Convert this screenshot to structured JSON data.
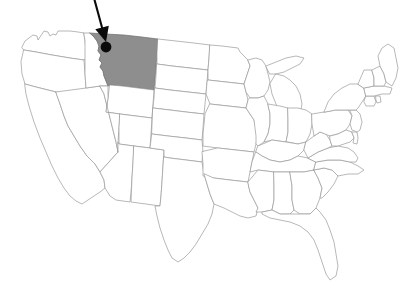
{
  "map": {
    "title": "Map of the United States",
    "type": "choropleth-locator",
    "region": "United States (contiguous 48 states)",
    "background_color": "#ffffff",
    "border_color": "#9a9a9a",
    "default_fill": "#ffffff",
    "highlight_fill": "#8e8e8e",
    "highlight_border_color": "#6f6f6f",
    "marker_color": "#0a0a0a",
    "annotation_color": "#0a0a0a",
    "highlighted_state": "Montana",
    "highlighted_state_abbr": "MT"
  },
  "marker": {
    "name": "location-dot",
    "label": "Marked location in northwestern Montana",
    "color": "#0a0a0a",
    "x": 106,
    "y": 47,
    "radius": 5.4
  },
  "annotation": {
    "name": "pointer-arrow",
    "label": "Arrow pointing to marked location",
    "color": "#0a0a0a",
    "from_x": 94,
    "from_y": -2,
    "to_x": 106,
    "to_y": 42
  },
  "legend": {
    "highlighted_label": "Montana",
    "marker_label": "Marked location"
  },
  "states": [
    {
      "abbr": "WA",
      "name": "Washington",
      "highlighted": false,
      "d": "M22,47 L25,41 L33,35 L37,36 L38,40 L42,34 L44,31 L48,32 L50,36 L53,34 L56,35 L58,31 L63,31 L70,31 L78,32 L84,33 L85,41 L86,50 L86,58 L84,60 L70,58 L52,55 L36,52 L24,50 Z"
    },
    {
      "abbr": "OR",
      "name": "Oregon",
      "highlighted": false,
      "d": "M24,50 L36,52 L52,55 L70,58 L84,60 L85,74 L86,88 L87,98 L70,95 L52,91 L36,87 L25,84 L22,74 L21,62 Z"
    },
    {
      "abbr": "CA",
      "name": "California",
      "highlighted": false,
      "d": "M25,84 L36,87 L52,91 L56,92 L60,104 L64,116 L68,126 L74,136 L80,146 L87,156 L95,164 L100,172 L104,180 L105,188 L100,192 L94,196 L88,200 L82,204 L76,201 L70,196 L64,188 L58,178 L52,166 L46,152 L40,138 L34,122 L29,106 L26,94 Z"
    },
    {
      "abbr": "NV",
      "name": "Nevada",
      "highlighted": false,
      "d": "M56,92 L86,88 L100,86 L104,94 L108,110 L112,126 L116,142 L118,152 L100,172 L95,164 L87,156 L80,146 L74,136 L68,126 L64,116 L60,104 Z"
    },
    {
      "abbr": "ID",
      "name": "Idaho",
      "highlighted": false,
      "d": "M84,33 L90,33 L94,37 L97,41 L99,46 L98,51 L101,55 L99,60 L102,63 L100,67 L103,71 L104,76 L106,81 L108,86 L100,86 L86,88 L85,74 L85,60 L85,41 Z"
    },
    {
      "abbr": "MT",
      "name": "Montana",
      "highlighted": true,
      "d": "M90,33 L106,34 L124,35 L142,37 L158,39 L157,53 L156,66 L155,79 L154,90 L138,88 L122,86 L110,85 L108,86 L106,81 L104,76 L103,71 L100,67 L102,63 L99,60 L101,55 L98,51 L99,46 L97,41 L94,37 Z"
    },
    {
      "abbr": "WY",
      "name": "Wyoming",
      "highlighted": false,
      "d": "M110,85 L122,86 L138,88 L154,90 L153,104 L152,118 L136,116 L120,114 L106,112 L108,98 Z"
    },
    {
      "abbr": "UT",
      "name": "Utah",
      "highlighted": false,
      "d": "M100,86 L108,86 L108,98 L106,112 L120,114 L119,128 L118,142 L118,152 L116,142 L112,126 L108,110 L104,94 Z"
    },
    {
      "abbr": "CO",
      "name": "Colorado",
      "highlighted": false,
      "d": "M120,114 L136,116 L152,118 L151,134 L150,148 L134,146 L119,144 L119,128 Z"
    },
    {
      "abbr": "AZ",
      "name": "Arizona",
      "highlighted": false,
      "d": "M118,152 L118,142 L119,144 L134,146 L133,162 L132,178 L131,192 L130,202 L116,200 L110,196 L105,188 L104,180 L100,172 L118,152 Z"
    },
    {
      "abbr": "NM",
      "name": "New Mexico",
      "highlighted": false,
      "d": "M134,146 L150,148 L164,150 L163,166 L162,182 L161,196 L160,206 L146,204 L131,202 L132,178 L133,162 Z"
    },
    {
      "abbr": "ND",
      "name": "North Dakota",
      "highlighted": false,
      "d": "M158,39 L176,41 L194,43 L210,45 L209,58 L208,70 L190,68 L172,66 L157,64 L157,53 Z"
    },
    {
      "abbr": "SD",
      "name": "South Dakota",
      "highlighted": false,
      "d": "M157,64 L172,66 L190,68 L208,70 L207,82 L206,94 L188,92 L170,90 L155,88 L156,76 Z"
    },
    {
      "abbr": "NE",
      "name": "Nebraska",
      "highlighted": false,
      "d": "M155,88 L170,90 L188,92 L206,94 L205,104 L204,114 L186,112 L170,110 L153,108 L154,98 Z"
    },
    {
      "abbr": "KS",
      "name": "Kansas",
      "highlighted": false,
      "d": "M153,108 L170,110 L186,112 L204,114 L203,128 L202,140 L186,138 L168,136 L152,134 Z"
    },
    {
      "abbr": "OK",
      "name": "Oklahoma",
      "highlighted": false,
      "d": "M152,134 L168,136 L186,138 L202,140 L203,152 L202,162 L186,160 L170,158 L164,157 L164,150 L150,148 L151,140 Z"
    },
    {
      "abbr": "TX",
      "name": "Texas",
      "highlighted": false,
      "d": "M164,157 L170,158 L186,160 L202,162 L204,174 L207,184 L210,194 L214,204 L212,214 L208,224 L202,234 L196,244 L190,252 L184,258 L178,262 L172,258 L168,250 L164,240 L160,228 L157,216 L155,206 L160,206 L161,196 L162,182 L163,166 Z"
    },
    {
      "abbr": "MN",
      "name": "Minnesota",
      "highlighted": false,
      "d": "M210,45 L222,46 L230,47 L238,48 L240,52 L244,56 L248,60 L250,66 L248,72 L246,78 L244,84 L226,82 L208,80 L208,70 L209,58 Z"
    },
    {
      "abbr": "IA",
      "name": "Iowa",
      "highlighted": false,
      "d": "M208,80 L226,82 L244,84 L246,92 L248,100 L246,108 L228,106 L210,104 L206,94 L207,82 Z"
    },
    {
      "abbr": "MO",
      "name": "Missouri",
      "highlighted": false,
      "d": "M210,104 L228,106 L246,108 L250,114 L254,120 L256,128 L258,136 L256,144 L254,152 L236,150 L218,148 L203,146 L203,134 L204,124 L205,114 Z"
    },
    {
      "abbr": "AR",
      "name": "Arkansas",
      "highlighted": false,
      "d": "M218,148 L236,150 L254,152 L252,162 L250,172 L248,182 L230,180 L214,178 L203,176 L203,164 L202,152 Z"
    },
    {
      "abbr": "LA",
      "name": "Louisiana",
      "highlighted": false,
      "d": "M214,178 L230,180 L248,182 L250,192 L254,200 L258,208 L256,216 L248,218 L240,216 L232,212 L224,208 L214,204 L210,194 L207,184 L204,174 Z"
    },
    {
      "abbr": "WI",
      "name": "Wisconsin",
      "highlighted": false,
      "d": "M248,60 L256,58 L262,60 L266,66 L268,74 L270,82 L268,90 L264,96 L258,98 L250,98 L246,92 L244,84 L246,78 L248,72 L250,66 Z"
    },
    {
      "abbr": "MI",
      "name": "Michigan",
      "highlighted": false,
      "d": "M266,66 L276,62 L286,58 L296,56 L304,58 L300,64 L292,68 L284,72 L276,74 L270,74 Z M276,74 L284,76 L290,80 L296,86 L300,94 L302,104 L300,114 L296,122 L290,126 L284,122 L280,114 L276,104 L272,94 L270,84 Z"
    },
    {
      "abbr": "IL",
      "name": "Illinois",
      "highlighted": false,
      "d": "M250,98 L258,98 L264,96 L268,104 L270,114 L270,124 L268,134 L264,142 L258,146 L256,144 L256,136 L254,120 L250,114 L246,108 L248,100 Z"
    },
    {
      "abbr": "IN",
      "name": "Indiana",
      "highlighted": false,
      "d": "M268,104 L280,106 L288,108 L288,120 L288,132 L286,142 L272,140 L264,142 L268,134 L270,124 L270,114 Z"
    },
    {
      "abbr": "OH",
      "name": "Ohio",
      "highlighted": false,
      "d": "M288,108 L298,108 L306,110 L312,114 L312,124 L310,134 L306,142 L298,144 L288,142 L286,142 L288,132 L288,120 Z"
    },
    {
      "abbr": "KY",
      "name": "Kentucky",
      "highlighted": false,
      "d": "M258,146 L272,140 L286,142 L298,144 L306,142 L304,150 L298,156 L290,160 L280,162 L270,160 L262,156 L256,152 Z"
    },
    {
      "abbr": "TN",
      "name": "Tennessee",
      "highlighted": false,
      "d": "M256,152 L262,156 L270,160 L280,162 L290,160 L298,156 L308,158 L316,162 L314,170 L304,172 L290,172 L274,172 L258,170 L250,172 L252,162 Z"
    },
    {
      "abbr": "MS",
      "name": "Mississippi",
      "highlighted": false,
      "d": "M248,182 L258,170 L274,172 L274,186 L274,200 L272,210 L262,212 L256,212 L258,208 L254,200 L250,192 Z"
    },
    {
      "abbr": "AL",
      "name": "Alabama",
      "highlighted": false,
      "d": "M274,172 L290,172 L292,186 L292,200 L294,210 L290,214 L280,214 L272,210 L274,200 L274,186 Z"
    },
    {
      "abbr": "GA",
      "name": "Georgia",
      "highlighted": false,
      "d": "M290,172 L304,172 L314,170 L318,178 L322,188 L320,198 L316,208 L310,214 L300,214 L294,210 L292,200 L292,186 Z"
    },
    {
      "abbr": "FL",
      "name": "Florida",
      "highlighted": false,
      "d": "M290,214 L300,214 L310,214 L316,208 L320,212 L326,220 L330,230 L334,242 L336,254 L338,266 L336,276 L330,280 L326,274 L322,262 L318,250 L314,240 L308,232 L300,226 L290,222 L280,220 L270,218 L262,214 L262,212 L272,210 L280,214 Z"
    },
    {
      "abbr": "SC",
      "name": "South Carolina",
      "highlighted": false,
      "d": "M314,170 L324,168 L332,170 L338,176 L334,184 L328,192 L322,198 L320,198 L322,188 L318,178 Z"
    },
    {
      "abbr": "NC",
      "name": "North Carolina",
      "highlighted": false,
      "d": "M316,162 L328,160 L340,160 L350,162 L358,166 L364,170 L358,174 L348,174 L338,176 L332,170 L324,168 L314,170 Z"
    },
    {
      "abbr": "VA",
      "name": "Virginia",
      "highlighted": false,
      "d": "M308,158 L318,152 L328,148 L338,146 L348,148 L354,152 L358,158 L356,162 L350,162 L340,160 L328,160 L316,162 Z"
    },
    {
      "abbr": "WV",
      "name": "West Virginia",
      "highlighted": false,
      "d": "M306,142 L314,136 L320,132 L326,134 L330,140 L332,146 L328,148 L318,152 L308,158 L304,150 Z"
    },
    {
      "abbr": "PA",
      "name": "Pennsylvania",
      "highlighted": false,
      "d": "M312,114 L324,112 L336,110 L348,110 L352,116 L350,124 L346,130 L338,134 L330,136 L320,132 L314,136 L312,124 Z"
    },
    {
      "abbr": "MD",
      "name": "Maryland",
      "highlighted": false,
      "d": "M330,136 L338,134 L346,130 L352,132 L354,138 L350,142 L344,144 L338,146 L332,146 L330,140 Z"
    },
    {
      "abbr": "DE",
      "name": "Delaware",
      "highlighted": false,
      "d": "M352,132 L357,132 L358,138 L357,144 L353,143 L354,138 Z"
    },
    {
      "abbr": "NJ",
      "name": "New Jersey",
      "highlighted": false,
      "d": "M350,110 L356,110 L360,114 L362,122 L360,130 L357,132 L352,130 L350,124 L352,116 Z"
    },
    {
      "abbr": "NY",
      "name": "New York",
      "highlighted": false,
      "d": "M324,112 L328,102 L334,94 L342,88 L350,84 L358,84 L364,88 L366,96 L362,102 L358,108 L356,110 L350,110 L348,110 L336,110 Z"
    },
    {
      "abbr": "CT",
      "name": "Connecticut",
      "highlighted": false,
      "d": "M366,96 L374,96 L376,102 L374,106 L366,106 L364,102 Z"
    },
    {
      "abbr": "RI",
      "name": "Rhode Island",
      "highlighted": false,
      "d": "M376,96 L380,96 L381,102 L377,103 L376,100 Z"
    },
    {
      "abbr": "MA",
      "name": "Massachusetts",
      "highlighted": false,
      "d": "M364,88 L374,86 L384,86 L392,88 L390,94 L382,94 L374,96 L366,96 Z"
    },
    {
      "abbr": "VT",
      "name": "Vermont",
      "highlighted": false,
      "d": "M358,84 L364,70 L372,70 L374,78 L374,86 L364,88 Z"
    },
    {
      "abbr": "NH",
      "name": "New Hampshire",
      "highlighted": false,
      "d": "M372,70 L380,66 L384,74 L386,82 L384,86 L374,86 L374,78 Z"
    },
    {
      "abbr": "ME",
      "name": "Maine",
      "highlighted": false,
      "d": "M380,66 L378,56 L382,48 L388,44 L394,48 L396,58 L398,68 L396,78 L392,86 L386,82 L384,74 Z"
    }
  ]
}
